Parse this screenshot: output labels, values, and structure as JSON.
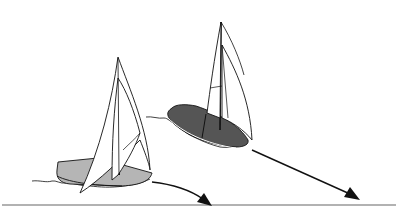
{
  "illustration": {
    "title": "Two sailboats heading on different courses",
    "colors": {
      "background": "#ffffff",
      "line": "#111111",
      "hull_light": "#b5b5b5",
      "hull_dark": "#555555",
      "ground_line": "#666666"
    },
    "boats": [
      {
        "name": "light-hull-sailboat",
        "hull_shade": "light",
        "course": "curved arrow to lower right"
      },
      {
        "name": "dark-hull-sailboat",
        "hull_shade": "dark",
        "course": "straight arrow to lower right"
      }
    ]
  }
}
